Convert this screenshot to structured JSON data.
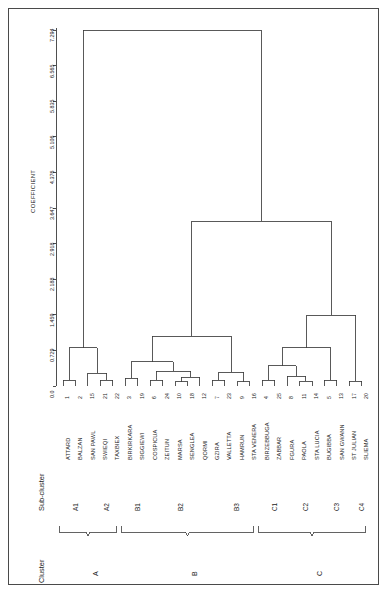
{
  "figure": {
    "type": "dendrogram",
    "orientation": "rotated-90",
    "axis_title": "COEFFICIENT",
    "header_cluster": "Cluster",
    "header_subcluster": "Sub-cluster"
  },
  "axis": {
    "label": "COEFFICIENT",
    "ticks": [
      "0.0",
      "0.729",
      "1.459",
      "2.188",
      "2.918",
      "3.647",
      "4.376",
      "5.106",
      "5.835",
      "6.565",
      "7.294"
    ],
    "tick_values": [
      0.0,
      0.729,
      1.459,
      2.188,
      2.918,
      3.647,
      4.376,
      5.106,
      5.835,
      6.565,
      7.294
    ],
    "min": 0.0,
    "max": 7.294
  },
  "leaves": [
    {
      "id": 1,
      "name": "ATTARD",
      "subcluster": "A1",
      "cluster": "A"
    },
    {
      "id": 2,
      "name": "BALZAN",
      "subcluster": "A1",
      "cluster": "A"
    },
    {
      "id": 15,
      "name": "SAN PAWL",
      "subcluster": "A2",
      "cluster": "A"
    },
    {
      "id": 21,
      "name": "SWIEQI",
      "subcluster": "A2",
      "cluster": "A"
    },
    {
      "id": 22,
      "name": "TAXBIEX",
      "subcluster": "A2",
      "cluster": "A"
    },
    {
      "id": 3,
      "name": "BIRKIRKARA",
      "subcluster": "B1",
      "cluster": "B"
    },
    {
      "id": 19,
      "name": "SIGGIEWI",
      "subcluster": "B1",
      "cluster": "B"
    },
    {
      "id": 6,
      "name": "COSPICUA",
      "subcluster": "B2",
      "cluster": "B"
    },
    {
      "id": 24,
      "name": "ZEITUN",
      "subcluster": "B2",
      "cluster": "B"
    },
    {
      "id": 10,
      "name": "MARSA",
      "subcluster": "B2",
      "cluster": "B"
    },
    {
      "id": 18,
      "name": "SENGLEA",
      "subcluster": "B2",
      "cluster": "B"
    },
    {
      "id": 12,
      "name": "QORMI",
      "subcluster": "B2",
      "cluster": "B"
    },
    {
      "id": 7,
      "name": "GZIRA",
      "subcluster": "B3",
      "cluster": "B"
    },
    {
      "id": 23,
      "name": "VALLETTA",
      "subcluster": "B3",
      "cluster": "B"
    },
    {
      "id": 9,
      "name": "HAMRUN",
      "subcluster": "B3",
      "cluster": "B"
    },
    {
      "id": 16,
      "name": "STA VENERA",
      "subcluster": "B3",
      "cluster": "B"
    },
    {
      "id": 4,
      "name": "BIRZEBBUGA",
      "subcluster": "C1",
      "cluster": "C"
    },
    {
      "id": 25,
      "name": "ZABBAR",
      "subcluster": "C1",
      "cluster": "C"
    },
    {
      "id": 8,
      "name": "FGURA",
      "subcluster": "C2",
      "cluster": "C"
    },
    {
      "id": 11,
      "name": "PAOLA",
      "subcluster": "C2",
      "cluster": "C"
    },
    {
      "id": 14,
      "name": "STA LUCIA",
      "subcluster": "C2",
      "cluster": "C"
    },
    {
      "id": 5,
      "name": "BUGIBBA",
      "subcluster": "C3",
      "cluster": "C"
    },
    {
      "id": 13,
      "name": "SAN GWANN",
      "subcluster": "C3",
      "cluster": "C"
    },
    {
      "id": 17,
      "name": "ST JULIAN",
      "subcluster": "C4",
      "cluster": "C"
    },
    {
      "id": 20,
      "name": "SLIEMA",
      "subcluster": "C4",
      "cluster": "C"
    }
  ],
  "subclusters": [
    {
      "label": "A1",
      "first_leaf": 0,
      "last_leaf": 1
    },
    {
      "label": "A2",
      "first_leaf": 2,
      "last_leaf": 4
    },
    {
      "label": "B1",
      "first_leaf": 5,
      "last_leaf": 6
    },
    {
      "label": "B2",
      "first_leaf": 7,
      "last_leaf": 11
    },
    {
      "label": "B3",
      "first_leaf": 12,
      "last_leaf": 15
    },
    {
      "label": "C1",
      "first_leaf": 16,
      "last_leaf": 17
    },
    {
      "label": "C2",
      "first_leaf": 18,
      "last_leaf": 20
    },
    {
      "label": "C3",
      "first_leaf": 21,
      "last_leaf": 22
    },
    {
      "label": "C4",
      "first_leaf": 23,
      "last_leaf": 24
    }
  ],
  "clusters": [
    {
      "label": "A",
      "first_leaf": 0,
      "last_leaf": 4
    },
    {
      "label": "B",
      "first_leaf": 5,
      "last_leaf": 15
    },
    {
      "label": "C",
      "first_leaf": 16,
      "last_leaf": 24
    }
  ],
  "chart_data": {
    "type": "dendrogram",
    "title": "",
    "xlabel": "COEFFICIENT",
    "ylabel": "",
    "xlim": [
      0.0,
      7.294
    ],
    "grid": false,
    "legend": "none",
    "linkage_note": "Heights read off the COEFFICIENT axis; leaves are ordered top-to-bottom as listed.",
    "merges": [
      {
        "id": "m1",
        "left": "leaf:1",
        "right": "leaf:2",
        "height": 0.12
      },
      {
        "id": "m2",
        "left": "leaf:21",
        "right": "leaf:22",
        "height": 0.12
      },
      {
        "id": "m3",
        "left": "leaf:15",
        "right": "m2",
        "height": 0.26
      },
      {
        "id": "m4",
        "left": "m1",
        "right": "m3",
        "height": 0.78
      },
      {
        "id": "m5",
        "left": "leaf:3",
        "right": "leaf:19",
        "height": 0.16
      },
      {
        "id": "m6",
        "left": "leaf:10",
        "right": "leaf:18",
        "height": 0.09
      },
      {
        "id": "m7",
        "left": "m6",
        "right": "leaf:12",
        "height": 0.18
      },
      {
        "id": "m8",
        "left": "leaf:6",
        "right": "leaf:24",
        "height": 0.12
      },
      {
        "id": "m9",
        "left": "m8",
        "right": "m7",
        "height": 0.3
      },
      {
        "id": "m10",
        "left": "m5",
        "right": "m9",
        "height": 0.5
      },
      {
        "id": "m11",
        "left": "leaf:7",
        "right": "leaf:23",
        "height": 0.12
      },
      {
        "id": "m12",
        "left": "leaf:9",
        "right": "leaf:16",
        "height": 0.09
      },
      {
        "id": "m13",
        "left": "m11",
        "right": "m12",
        "height": 0.28
      },
      {
        "id": "m14",
        "left": "m10",
        "right": "m13",
        "height": 1.02
      },
      {
        "id": "m15",
        "left": "leaf:4",
        "right": "leaf:25",
        "height": 0.12
      },
      {
        "id": "m16",
        "left": "leaf:11",
        "right": "leaf:14",
        "height": 0.1
      },
      {
        "id": "m17",
        "left": "leaf:8",
        "right": "m16",
        "height": 0.2
      },
      {
        "id": "m18",
        "left": "m15",
        "right": "m17",
        "height": 0.42
      },
      {
        "id": "m19",
        "left": "leaf:5",
        "right": "leaf:13",
        "height": 0.12
      },
      {
        "id": "m20",
        "left": "m18",
        "right": "m19",
        "height": 0.78
      },
      {
        "id": "m21",
        "left": "leaf:17",
        "right": "leaf:20",
        "height": 0.1
      },
      {
        "id": "m22",
        "left": "m20",
        "right": "m21",
        "height": 1.45
      },
      {
        "id": "m23",
        "left": "m14",
        "right": "m22",
        "height": 3.38
      },
      {
        "id": "m24",
        "left": "m4",
        "right": "m23",
        "height": 7.29
      }
    ]
  }
}
